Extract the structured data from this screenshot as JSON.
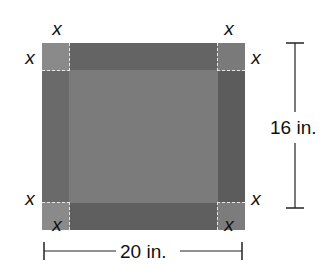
{
  "diagram": {
    "sheet": {
      "width_label": "20 in.",
      "height_label": "16 in.",
      "fill_color": "#6c6c6c",
      "corner_fill_color": "#8a8a8a",
      "fold_line_color": "#e6e6e6"
    },
    "corner_labels": {
      "top_left_top": "x",
      "top_left_side": "x",
      "top_right_top": "x",
      "top_right_side": "x",
      "bottom_left_side": "x",
      "bottom_left_bottom": "x",
      "bottom_right_side": "x",
      "bottom_right_bottom": "x"
    },
    "dimensions": {
      "horizontal": "20 in.",
      "vertical": "16 in."
    }
  }
}
